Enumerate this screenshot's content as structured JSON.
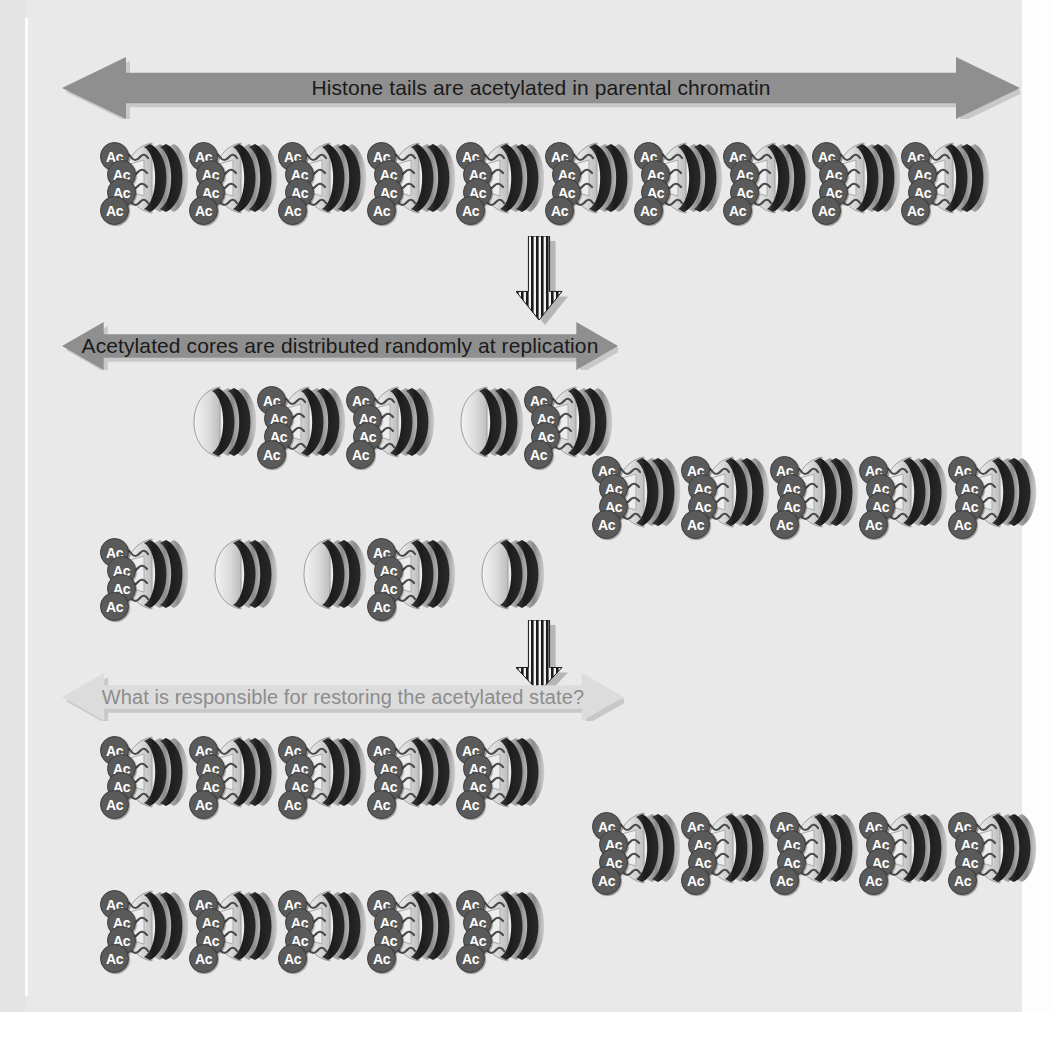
{
  "figure": {
    "background_color": "#e9e9e9",
    "panel_color": "#e9e9e9"
  },
  "colors": {
    "arrow_dark_gray": "#8f8f8f",
    "arrow_light_gray": "#dcdcdc",
    "arrow_text_dark": "#1a1a1a",
    "arrow_text_light": "#8c8c8c",
    "ac_ball_fill": "#5a5a5a",
    "ac_ball_text": "#ffffff",
    "core_dark": "#231f20",
    "core_light": "#d9d9d9",
    "core_mid": "#9a9a9a",
    "tail_fill": "#e3e3e3"
  },
  "banners": [
    {
      "id": "banner-parental",
      "text": "Histone tails are acetylated in parental chromatin",
      "style": "dark",
      "fill": "#8f8f8f",
      "text_color": "#1a1a1a",
      "x": 62,
      "y": 57,
      "width": 958,
      "height": 62
    },
    {
      "id": "banner-replication",
      "text": "Acetylated cores are distributed randomly at replication",
      "style": "dark",
      "fill": "#8f8f8f",
      "text_color": "#1a1a1a",
      "x": 62,
      "y": 322,
      "width": 556,
      "height": 48
    },
    {
      "id": "banner-question",
      "text": "What is responsible for restoring the acetylated state?",
      "style": "light",
      "fill": "#dcdcdc",
      "text_color": "#8c8c8c",
      "x": 62,
      "y": 673,
      "width": 562,
      "height": 48
    }
  ],
  "down_arrows": [
    {
      "id": "down-arrow-replication",
      "x": 516,
      "y": 236,
      "width": 46,
      "height": 84
    },
    {
      "id": "down-arrow-restoration",
      "x": 516,
      "y": 620,
      "width": 46,
      "height": 72
    }
  ],
  "legend": {
    "acetyl_label": "Ac",
    "acetylated_description": "nucleosome core with acetylated histone tails",
    "unacetylated_description": "nucleosome core without acetylated histone tails"
  },
  "sections": [
    {
      "id": "section-parental",
      "name": "parental-chromatin",
      "rows": [
        {
          "id": "row-parental-1",
          "x": 100,
          "y": 136,
          "spacing": 89,
          "nucleosomes": [
            "ac",
            "ac",
            "ac",
            "ac",
            "ac",
            "ac",
            "ac",
            "ac",
            "ac",
            "ac"
          ]
        }
      ]
    },
    {
      "id": "section-daughters",
      "name": "daughter-chromatin-after-replication",
      "rows": [
        {
          "id": "row-daughter-a1",
          "x": 168,
          "y": 380,
          "spacing": 89,
          "nucleosomes": [
            "plain",
            "ac",
            "ac",
            "plain",
            "ac"
          ]
        },
        {
          "id": "row-daughter-a2",
          "x": 592,
          "y": 450,
          "spacing": 89,
          "nucleosomes": [
            "ac",
            "ac",
            "ac",
            "ac",
            "ac"
          ]
        },
        {
          "id": "row-daughter-b1",
          "x": 100,
          "y": 532,
          "spacing": 89,
          "nucleosomes": [
            "ac",
            "plain",
            "plain",
            "ac",
            "plain"
          ]
        }
      ]
    },
    {
      "id": "section-restored",
      "name": "restored-acetylated-chromatin",
      "rows": [
        {
          "id": "row-restored-a1",
          "x": 100,
          "y": 730,
          "spacing": 89,
          "nucleosomes": [
            "ac",
            "ac",
            "ac",
            "ac",
            "ac"
          ]
        },
        {
          "id": "row-restored-a2",
          "x": 592,
          "y": 806,
          "spacing": 89,
          "nucleosomes": [
            "ac",
            "ac",
            "ac",
            "ac",
            "ac"
          ]
        },
        {
          "id": "row-restored-b1",
          "x": 100,
          "y": 884,
          "spacing": 89,
          "nucleosomes": [
            "ac",
            "ac",
            "ac",
            "ac",
            "ac"
          ]
        }
      ]
    }
  ]
}
